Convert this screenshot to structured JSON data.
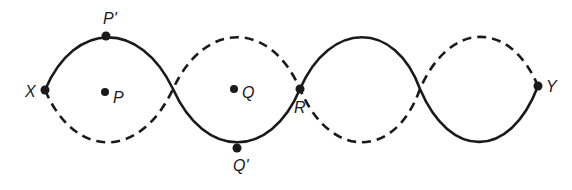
{
  "diagram": {
    "colors": {
      "line": "#1a1a1a",
      "background": "#ffffff"
    },
    "ends": {
      "left": "X",
      "right": "Y"
    },
    "labels": {
      "x": "X",
      "y": "Y",
      "p": "P",
      "p_prime": "P'",
      "q": "Q",
      "q_prime": "Q'",
      "r": "R"
    },
    "loops": 4,
    "solid_curve": "displacement at one instant",
    "dashed_curve": "displacement half a period later"
  }
}
